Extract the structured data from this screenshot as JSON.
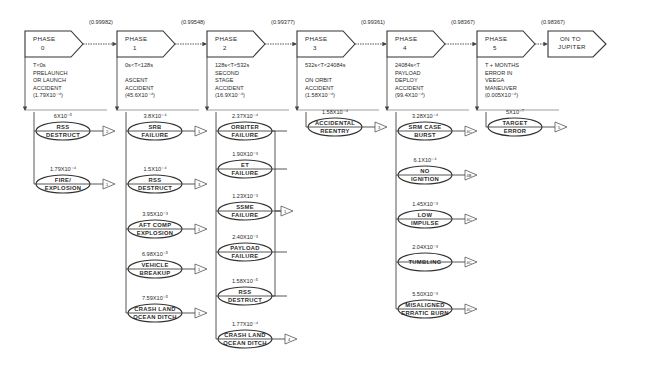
{
  "phases": [
    {
      "id": "phase-0",
      "label_line1": "PHASE",
      "label_line2": "0",
      "reliability": "(0.99982)",
      "desc": [
        "T<0s",
        "PRELAUNCH",
        "OR LAUNCH",
        "ACCIDENT",
        "(1.79X10⁻⁴)"
      ],
      "failures": [
        {
          "prob": "6X10⁻⁵",
          "line1": "RSS",
          "line2": "DESTRUCT",
          "tri": "2"
        },
        {
          "prob": "1.79X10⁻⁴",
          "line1": "FIRE/",
          "line2": "EXPLOSION",
          "tri": "1"
        }
      ]
    },
    {
      "id": "phase-1",
      "label_line1": "PHASE",
      "label_line2": "1",
      "reliability": "(0.99548)",
      "desc": [
        "0s<T<128s",
        "",
        "ASCENT",
        "ACCIDENT",
        "(45.6X10⁻⁴)"
      ],
      "failures": [
        {
          "prob": "3.8X10⁻⁴",
          "line1": "SRB",
          "line2": "FAILURE",
          "tri": "1"
        },
        {
          "prob": "1.5X10⁻⁴",
          "line1": "RSS",
          "line2": "DESTRUCT",
          "tri": "3"
        },
        {
          "prob": "3.95X10⁻³",
          "line1": "AFT COMP",
          "line2": "EXPLOSION",
          "tri": "1"
        },
        {
          "prob": "6.98X10⁻⁵",
          "line1": "VEHICLE",
          "line2": "BREAKUP",
          "tri": "1"
        },
        {
          "prob": "7.59X10⁻⁵",
          "line1": "CRASH LAND",
          "line2": "OCEAN DITCH",
          "tri": "1"
        }
      ]
    },
    {
      "id": "phase-2",
      "label_line1": "PHASE",
      "label_line2": "2",
      "reliability": "(0.99377)",
      "desc": [
        "128s<T<532s",
        "SECOND",
        "STAGE",
        "ACCIDENT",
        "(16.9X10⁻⁴)"
      ],
      "failures": [
        {
          "prob": "2.37X10⁻⁴",
          "line1": "ORBITER",
          "line2": "FAILURE"
        },
        {
          "prob": "1.90X10⁻³",
          "line1": "ET",
          "line2": "FAILURE"
        },
        {
          "prob": "1.23X10⁻³",
          "line1": "SSME",
          "line2": "FAILURE"
        },
        {
          "prob": "2.40X10⁻³",
          "line1": "PAYLOAD",
          "line2": "FAILURE"
        },
        {
          "prob": "1.58X10⁻⁵",
          "line1": "RSS",
          "line2": "DESTRUCT"
        },
        {
          "prob": "1.77X10⁻⁴",
          "line1": "CRASH LAND",
          "line2": "OCEAN DITCH",
          "tri": "4"
        }
      ],
      "group_tri": "1"
    },
    {
      "id": "phase-3",
      "label_line1": "PHASE",
      "label_line2": "3",
      "reliability": "(0.99361)",
      "desc": [
        "532s<T<24084s",
        "",
        "ON ORBIT",
        "ACCIDENT",
        "(1.58X10⁻⁴)"
      ],
      "failures": [
        {
          "prob": "1.58X10⁻⁴",
          "line1": "ACCIDENTAL",
          "line2": "REENTRY",
          "tri": "3"
        }
      ]
    },
    {
      "id": "phase-4",
      "label_line1": "PHASE",
      "label_line2": "4",
      "reliability": "(0.98367)",
      "desc": [
        "24084s<T",
        "PAYLOAD",
        "DEPLOY",
        "ACCIDENT",
        "(99.4X10⁻⁴)"
      ],
      "failures": [
        {
          "prob": "3.28X10⁻⁴",
          "line1": "SRM CASE",
          "line2": "BURST",
          "tri": "4C"
        },
        {
          "prob": "6.1X10⁻⁴",
          "line1": "NO",
          "line2": "IGNITION",
          "tri": "4B"
        },
        {
          "prob": "1.45X10⁻³",
          "line1": "LOW",
          "line2": "IMPULSE",
          "tri": "4C"
        },
        {
          "prob": "2.04X10⁻³",
          "line1": "TUMBLING",
          "line2": "",
          "tri": "4C"
        },
        {
          "prob": "5.50X10⁻³",
          "line1": "MISALIGNED",
          "line2": "ERRATIC BURN",
          "tri": "4C"
        }
      ]
    },
    {
      "id": "phase-5",
      "label_line1": "PHASE",
      "label_line2": "5",
      "reliability": "(0.98367)",
      "desc": [
        "T + MONTHS",
        "ERROR IN",
        "VEEGA",
        "MANEUVER",
        "(0.005X10⁻⁴)"
      ],
      "failures": [
        {
          "prob": "5X10⁻⁷",
          "line1": "TARGET",
          "line2": "ERROR",
          "tri": "5"
        }
      ]
    }
  ],
  "final": {
    "line1": "ON TO",
    "line2": "JUPITER"
  },
  "colors": {
    "ink": "#2a2a2a",
    "line": "#555555",
    "background": "#ffffff"
  }
}
